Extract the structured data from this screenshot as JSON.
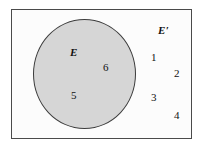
{
  "figure": {
    "type": "venn-diagram",
    "colors": {
      "circle_fill": "#d6d6d6",
      "circle_stroke": "#3c3c3c",
      "frame_stroke": "#4a4a4a",
      "frame_fill": "#fcfcfc",
      "text": "#111111"
    }
  },
  "sets": {
    "event_label": "E",
    "complement_label": "E′"
  },
  "outcomes": {
    "inside_event": [
      {
        "value": "6"
      },
      {
        "value": "5"
      }
    ],
    "outside_event": [
      {
        "value": "1"
      },
      {
        "value": "2"
      },
      {
        "value": "3"
      },
      {
        "value": "4"
      }
    ]
  }
}
